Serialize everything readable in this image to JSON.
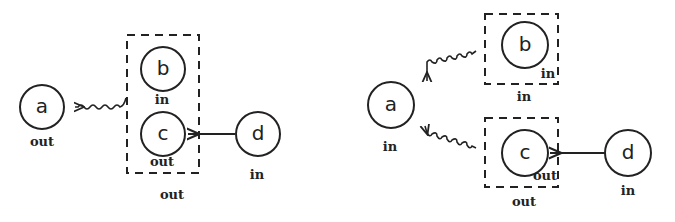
{
  "left_diagram": {
    "nodes": {
      "a": {
        "letter": "a",
        "label": "out"
      },
      "b": {
        "letter": "b",
        "label": "in"
      },
      "c": {
        "letter": "c",
        "label": "out"
      },
      "d": {
        "letter": "d",
        "label": "in"
      }
    },
    "group_bc": {
      "label": "out"
    },
    "edges": [
      {
        "from": "group_bc",
        "to": "a",
        "style": "wavy"
      },
      {
        "from": "d",
        "to": "c",
        "style": "straight"
      }
    ]
  },
  "right_diagram": {
    "nodes": {
      "a": {
        "letter": "a",
        "label": "in"
      },
      "b": {
        "letter": "b",
        "label": "in"
      },
      "c": {
        "letter": "c",
        "label": "out"
      },
      "d": {
        "letter": "d",
        "label": "in"
      }
    },
    "group_b": {
      "label": "in"
    },
    "group_c": {
      "label": "out"
    },
    "edges": [
      {
        "from": "group_b",
        "to": "a",
        "style": "wavy"
      },
      {
        "from": "group_c",
        "to": "a",
        "style": "wavy"
      },
      {
        "from": "d",
        "to": "c",
        "style": "straight"
      }
    ]
  }
}
